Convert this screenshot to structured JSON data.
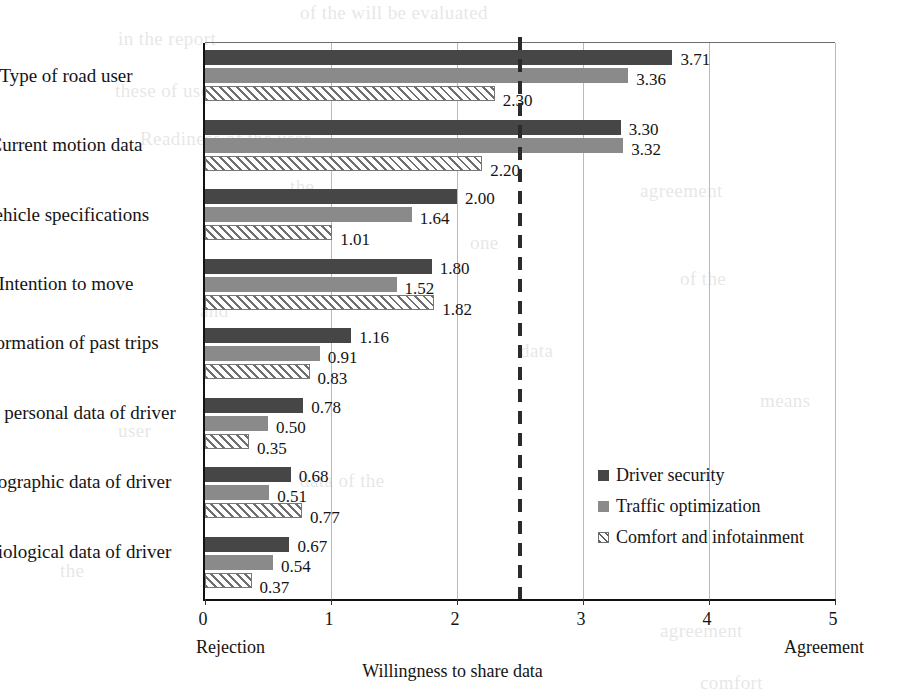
{
  "chart_data": {
    "type": "bar",
    "orientation": "horizontal",
    "title": "",
    "xlabel": "Willingness to share data",
    "ylabel": "",
    "xlim": [
      0,
      5
    ],
    "xticks": [
      "0",
      "1",
      "2",
      "3",
      "4",
      "5"
    ],
    "grid": true,
    "legend_position": "inside-right",
    "categories": [
      "Type of road user",
      "Current motion data",
      "Vehicle specifications",
      "Intention to move",
      "Information of past trips",
      "Other personal data of driver",
      "Demographic data of driver",
      "Physiological data of driver"
    ],
    "series": [
      {
        "name": "Driver security",
        "color": "#464646",
        "values": [
          3.71,
          3.3,
          2.0,
          1.8,
          1.16,
          0.78,
          0.68,
          0.67
        ],
        "labels": [
          "3.71",
          "3.30",
          "2.00",
          "1.80",
          "1.16",
          "0.78",
          "0.68",
          "0.67"
        ]
      },
      {
        "name": "Traffic optimization",
        "color": "#8a8a8a",
        "values": [
          3.36,
          3.32,
          1.64,
          1.52,
          0.91,
          0.5,
          0.51,
          0.54
        ],
        "labels": [
          "3.36",
          "3.32",
          "1.64",
          "1.52",
          "0.91",
          "0.50",
          "0.51",
          "0.54"
        ]
      },
      {
        "name": "Comfort and infotainment",
        "color": "#ffffff",
        "pattern": "diagonal-hatch",
        "values": [
          2.3,
          2.2,
          1.01,
          1.82,
          0.83,
          0.35,
          0.77,
          0.37
        ],
        "labels": [
          "2.30",
          "2.20",
          "1.01",
          "1.82",
          "0.83",
          "0.35",
          "0.77",
          "0.37"
        ]
      }
    ],
    "annotations": {
      "left_axis_caption": "Rejection",
      "right_axis_caption": "Agreement",
      "threshold_line_value": 2.5
    }
  },
  "axis": {
    "title": "Willingness to share data",
    "left_caption": "Rejection",
    "right_caption": "Agreement",
    "ticks": [
      "0",
      "1",
      "2",
      "3",
      "4",
      "5"
    ]
  },
  "legend": {
    "items": [
      {
        "label": "Driver security"
      },
      {
        "label": "Traffic optimization"
      },
      {
        "label": "Comfort and infotainment"
      }
    ]
  },
  "background_text": [
    {
      "text": "of the will be evaluated",
      "x": 300,
      "y": 2
    },
    {
      "text": "in the report",
      "x": 118,
      "y": 28
    },
    {
      "text": "these of user",
      "x": 115,
      "y": 80
    },
    {
      "text": "Readiness of the user",
      "x": 140,
      "y": 128
    },
    {
      "text": "the",
      "x": 290,
      "y": 176
    },
    {
      "text": "agreement",
      "x": 640,
      "y": 180
    },
    {
      "text": "one",
      "x": 470,
      "y": 232
    },
    {
      "text": "of the",
      "x": 680,
      "y": 268
    },
    {
      "text": "and",
      "x": 200,
      "y": 300
    },
    {
      "text": "data",
      "x": 520,
      "y": 340
    },
    {
      "text": "means",
      "x": 760,
      "y": 390
    },
    {
      "text": "user",
      "x": 118,
      "y": 420
    },
    {
      "text": "agreement",
      "x": 660,
      "y": 620
    },
    {
      "text": "comfort",
      "x": 700,
      "y": 672
    },
    {
      "text": "the",
      "x": 60,
      "y": 560
    },
    {
      "text": "data of the",
      "x": 300,
      "y": 470
    }
  ]
}
